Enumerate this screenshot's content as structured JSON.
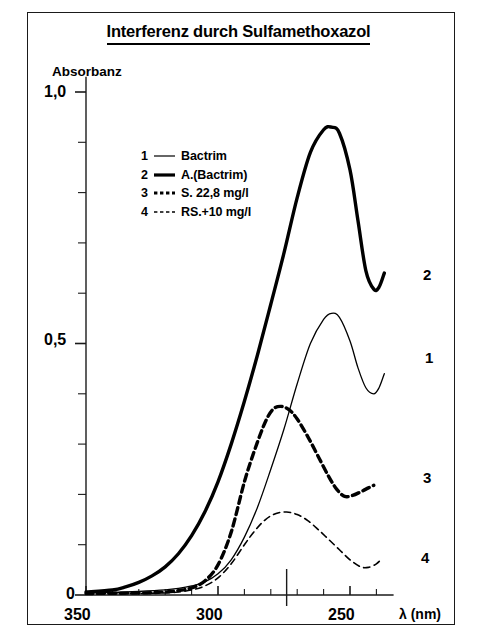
{
  "figure": {
    "title": "Interferenz durch Sulfamethoxazol",
    "y_axis_title": "Absorbanz",
    "x_axis_title": "λ (nm)"
  },
  "legend": {
    "items": [
      {
        "number": "1",
        "style": "thin-solid",
        "label": "Bactrim"
      },
      {
        "number": "2",
        "style": "thick-solid",
        "label": "A.(Bactrim)"
      },
      {
        "number": "3",
        "style": "thick-dash",
        "label": "S. 22,8 mg/l"
      },
      {
        "number": "4",
        "style": "thin-dash",
        "label": "RS.+10 mg/l"
      }
    ]
  },
  "axes": {
    "y_tick_labels": [
      "1,0",
      "0,5",
      "0"
    ],
    "x_tick_labels": [
      "350",
      "300",
      "250"
    ]
  },
  "curve_end_labels": [
    "2",
    "1",
    "3",
    "4"
  ],
  "chart_data": {
    "type": "line",
    "title": "Interferenz durch Sulfamethoxazol",
    "xlabel": "λ (nm)",
    "ylabel": "Absorbanz",
    "xlim": [
      350,
      235
    ],
    "ylim": [
      0,
      1.05
    ],
    "x_ticks_major": [
      350,
      300,
      250
    ],
    "x_ticks_minor_step": 10,
    "y_ticks_major": [
      0,
      0.5,
      1.0
    ],
    "y_ticks_minor_step": 0.1,
    "x_axis_reversed": true,
    "grid": false,
    "legend_position": "upper-left-inside",
    "annotations": [
      {
        "type": "vertical-marker",
        "x": 274,
        "label": ""
      }
    ],
    "series": [
      {
        "name": "Bactrim",
        "legend_number": "1",
        "line": "thin-solid",
        "color": "#000000",
        "end_label": "1",
        "peak": {
          "x": 257,
          "y": 0.56
        },
        "minimum": {
          "x": 243,
          "y": 0.4
        },
        "x": [
          350,
          340,
          330,
          320,
          315,
          310,
          305,
          300,
          295,
          290,
          285,
          280,
          275,
          270,
          265,
          260,
          257,
          254,
          250,
          247,
          244,
          241,
          239,
          237
        ],
        "y": [
          0.004,
          0.005,
          0.007,
          0.01,
          0.013,
          0.018,
          0.026,
          0.042,
          0.07,
          0.115,
          0.175,
          0.25,
          0.33,
          0.42,
          0.5,
          0.548,
          0.56,
          0.552,
          0.505,
          0.452,
          0.412,
          0.4,
          0.412,
          0.44
        ]
      },
      {
        "name": "A.(Bactrim)",
        "legend_number": "2",
        "line": "thick-solid",
        "color": "#000000",
        "end_label": "2",
        "peak": {
          "x": 257,
          "y": 0.93
        },
        "minimum": {
          "x": 243,
          "y": 0.605
        },
        "x": [
          350,
          340,
          335,
          330,
          325,
          320,
          315,
          310,
          305,
          300,
          295,
          290,
          285,
          280,
          275,
          270,
          265,
          260,
          257,
          254,
          250,
          247,
          244,
          241,
          239,
          237
        ],
        "y": [
          0.006,
          0.01,
          0.016,
          0.025,
          0.038,
          0.056,
          0.082,
          0.118,
          0.165,
          0.225,
          0.3,
          0.385,
          0.478,
          0.578,
          0.68,
          0.79,
          0.88,
          0.925,
          0.93,
          0.918,
          0.845,
          0.745,
          0.645,
          0.608,
          0.612,
          0.64
        ]
      },
      {
        "name": "S. 22,8 mg/l",
        "legend_number": "3",
        "line": "thick-dash",
        "color": "#000000",
        "end_label": "3",
        "peak": {
          "x": 276,
          "y": 0.375
        },
        "minimum": {
          "x": 252,
          "y": 0.195
        },
        "x": [
          350,
          330,
          320,
          315,
          310,
          305,
          300,
          295,
          290,
          286,
          282,
          279,
          276,
          273,
          270,
          266,
          262,
          258,
          255,
          252,
          249,
          246,
          243,
          241
        ],
        "y": [
          0.003,
          0.004,
          0.006,
          0.009,
          0.014,
          0.028,
          0.06,
          0.125,
          0.225,
          0.29,
          0.345,
          0.37,
          0.375,
          0.368,
          0.35,
          0.315,
          0.275,
          0.235,
          0.21,
          0.196,
          0.198,
          0.205,
          0.213,
          0.218
        ]
      },
      {
        "name": "RS.+10 mg/l",
        "legend_number": "4",
        "line": "thin-dash",
        "color": "#000000",
        "end_label": "4",
        "peak": {
          "x": 274,
          "y": 0.165
        },
        "minimum": {
          "x": 246,
          "y": 0.055
        },
        "x": [
          350,
          330,
          320,
          315,
          310,
          305,
          300,
          295,
          290,
          286,
          282,
          278,
          274,
          270,
          266,
          262,
          258,
          254,
          250,
          246,
          243,
          240,
          238
        ],
        "y": [
          0.002,
          0.003,
          0.004,
          0.006,
          0.01,
          0.018,
          0.034,
          0.062,
          0.1,
          0.128,
          0.15,
          0.162,
          0.165,
          0.16,
          0.148,
          0.13,
          0.11,
          0.09,
          0.07,
          0.056,
          0.055,
          0.062,
          0.072
        ]
      }
    ]
  }
}
